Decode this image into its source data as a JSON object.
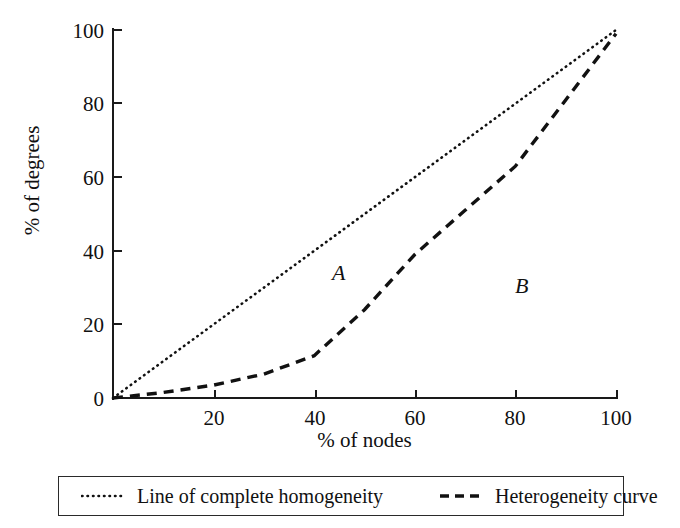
{
  "chart_data": {
    "type": "line",
    "title": "",
    "xlabel": "% of nodes",
    "ylabel": "% of degrees",
    "xlim": [
      0,
      100
    ],
    "ylim": [
      0,
      100
    ],
    "xticks": [
      0,
      20,
      40,
      60,
      80,
      100
    ],
    "yticks": [
      0,
      20,
      40,
      60,
      80,
      100
    ],
    "xtick_labels": [
      "0",
      "20",
      "40",
      "60",
      "80",
      "100"
    ],
    "ytick_labels": [
      "0",
      "20",
      "40",
      "60",
      "80",
      "100"
    ],
    "grid": false,
    "legend_position": "below-plot",
    "series": [
      {
        "name": "Line of complete homogeneity",
        "style": "dotted",
        "color": "#111111",
        "x": [
          0,
          20,
          40,
          60,
          80,
          100
        ],
        "y": [
          0,
          20,
          40,
          60,
          80,
          100
        ]
      },
      {
        "name": "Heterogeneity curve",
        "style": "dashed",
        "color": "#111111",
        "x": [
          0,
          10,
          20,
          30,
          40,
          50,
          60,
          70,
          80,
          90,
          100
        ],
        "y": [
          0,
          1.5,
          3.5,
          6.5,
          11.5,
          24,
          39,
          51,
          63,
          81,
          99
        ]
      }
    ],
    "annotations": [
      {
        "text": "A",
        "x": 45,
        "y": 35,
        "style": "italic"
      },
      {
        "text": "B",
        "x": 81,
        "y": 31,
        "style": "italic"
      }
    ]
  },
  "axes": {
    "y_title": "% of degrees",
    "x_title": "% of nodes",
    "y_tick_labels": [
      "100",
      "80",
      "60",
      "40",
      "20",
      "0"
    ],
    "x_tick_labels": [
      "0",
      "20",
      "40",
      "60",
      "80",
      "100"
    ]
  },
  "regions": {
    "a_label": "A",
    "b_label": "B"
  },
  "legend": {
    "entries": [
      {
        "label": "Line of complete homogeneity",
        "marker": "dotted-line-swatch"
      },
      {
        "label": "Heterogeneity curve",
        "marker": "dashed-line-swatch"
      }
    ]
  },
  "colors": {
    "ink": "#111111",
    "axis": "#1a1a1a",
    "background": "#ffffff"
  }
}
